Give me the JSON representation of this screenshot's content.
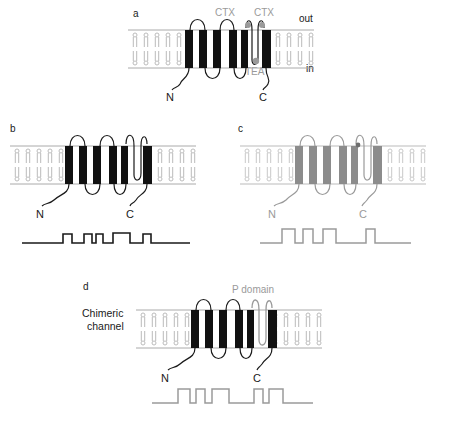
{
  "figure": {
    "type": "diagram",
    "background": "#ffffff"
  },
  "colors": {
    "black": "#111111",
    "gray": "#9a9a9a",
    "mid_gray": "#8c8c8c",
    "membrane_line": "#aaaaaa",
    "lipid": "#b3b3b3",
    "trace_black": "#1a1a1a",
    "trace_gray": "#9a9a9a"
  },
  "panels": [
    {
      "id": "a",
      "letter": "a",
      "helix_color": "#111111",
      "loop_color": "#1a1a1a",
      "terminal_labels": {
        "n": "N",
        "c": "C"
      },
      "membrane_labels": {
        "outside": "out",
        "inside": "in"
      },
      "blocker_labels": [
        {
          "name": "CTX",
          "text": "CTX",
          "color": "#9a9a9a"
        },
        {
          "name": "CTX",
          "text": "CTX",
          "color": "#9a9a9a"
        },
        {
          "name": "TEA",
          "text": "TEA",
          "color": "#9a9a9a"
        }
      ],
      "binding_dots": 3,
      "helix_count": 6,
      "has_trace": false
    },
    {
      "id": "b",
      "letter": "b",
      "helix_color": "#111111",
      "loop_color": "#1a1a1a",
      "terminal_labels": {
        "n": "N",
        "c": "C"
      },
      "helix_count": 6,
      "has_trace": true,
      "trace_color": "#1a1a1a"
    },
    {
      "id": "c",
      "letter": "c",
      "helix_color": "#8c8c8c",
      "loop_color": "#9a9a9a",
      "terminal_labels": {
        "n": "N",
        "c": "C"
      },
      "helix_count": 6,
      "has_trace": true,
      "trace_color": "#9a9a9a"
    },
    {
      "id": "d",
      "letter": "d",
      "title": "Chimeric\nchannel",
      "title_line1": "Chimeric",
      "title_line2": "channel",
      "helix_color": "#111111",
      "loop_color": "#1a1a1a",
      "pore_label": "P domain",
      "pore_color": "#9a9a9a",
      "terminal_labels": {
        "n": "N",
        "c": "C"
      },
      "helix_count": 6,
      "has_trace": true,
      "trace_color": "#9a9a9a"
    }
  ],
  "traces": {
    "b": {
      "label": "single-channel record b",
      "color": "#1a1a1a",
      "pulses": 5
    },
    "c": {
      "label": "single-channel record c",
      "color": "#9a9a9a",
      "pulses": 4
    },
    "d": {
      "label": "single-channel record d",
      "color": "#9a9a9a",
      "pulses": 5
    }
  }
}
